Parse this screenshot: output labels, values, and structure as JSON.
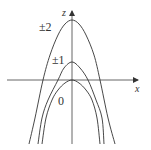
{
  "diagram": {
    "type": "traces of parabolas (level curves)",
    "axes": {
      "vertical_label": "z",
      "horizontal_label": "x",
      "color": "#444444"
    },
    "curves": [
      {
        "label": "±2",
        "vertex": [
          72,
          20
        ],
        "points": [
          [
            29,
            144
          ],
          [
            35,
            118
          ],
          [
            43,
            80
          ],
          [
            50,
            55
          ],
          [
            58,
            35
          ],
          [
            65,
            24
          ],
          [
            72,
            20
          ],
          [
            79,
            24
          ],
          [
            86,
            35
          ],
          [
            94,
            55
          ],
          [
            100,
            80
          ],
          [
            108,
            118
          ],
          [
            115,
            144
          ]
        ]
      },
      {
        "label": "±1",
        "vertex": [
          72,
          62
        ],
        "points": [
          [
            38,
            144
          ],
          [
            42,
            118
          ],
          [
            48,
            100
          ],
          [
            58,
            80
          ],
          [
            64,
            68
          ],
          [
            72,
            62
          ],
          [
            80,
            68
          ],
          [
            88,
            80
          ],
          [
            96,
            100
          ],
          [
            102,
            118
          ],
          [
            104,
            144
          ]
        ]
      },
      {
        "label": "0",
        "vertex": [
          72,
          80
        ],
        "points": [
          [
            42,
            144
          ],
          [
            46,
            118
          ],
          [
            52,
            100
          ],
          [
            58,
            90
          ],
          [
            65,
            83
          ],
          [
            72,
            80
          ],
          [
            79,
            83
          ],
          [
            86,
            90
          ],
          [
            92,
            100
          ],
          [
            97,
            118
          ],
          [
            100,
            144
          ]
        ]
      }
    ],
    "labels": {
      "z": "z",
      "x": "x",
      "pm2": "±2",
      "pm1": "±1",
      "zero": "0"
    },
    "stroke_color": "#333333"
  }
}
